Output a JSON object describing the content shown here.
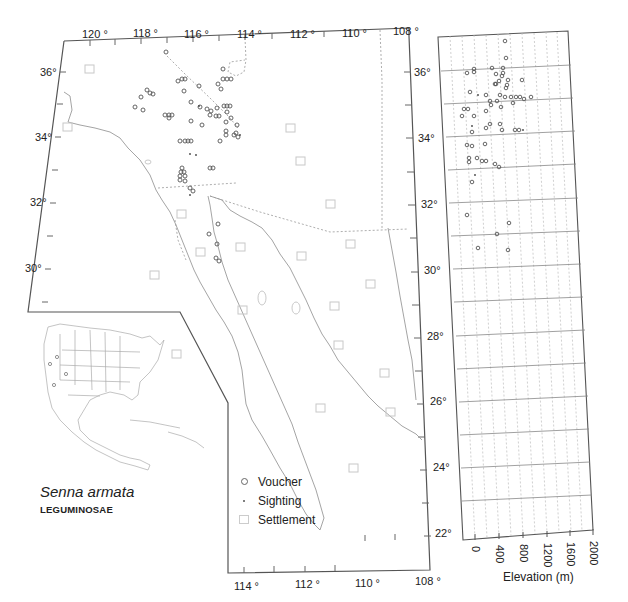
{
  "species": {
    "name": "Senna armata",
    "family": "LEGUMINOSAE"
  },
  "legend": {
    "items": [
      {
        "label": "Voucher",
        "symbol": "circle"
      },
      {
        "label": "Sighting",
        "symbol": "dot"
      },
      {
        "label": "Settlement",
        "symbol": "square"
      }
    ]
  },
  "main_map": {
    "top_longitude_labels": [
      "120 °",
      "118 °",
      "116 °",
      "114 °",
      "112 °",
      "110 °",
      "108 °"
    ],
    "bottom_longitude_labels": [
      "114 °",
      "112 °",
      "110 °",
      "108 °"
    ],
    "left_latitude_labels": [
      "36°",
      "34°",
      "32°",
      "30°"
    ],
    "right_latitude_labels": [
      "36°",
      "34°",
      "32°",
      "30°",
      "28°",
      "26°",
      "24°",
      "22°"
    ]
  },
  "elevation_panel": {
    "axis_title": "Elevation (m)",
    "x_ticks": [
      "0",
      "400",
      "800",
      "1200",
      "1600",
      "2000"
    ],
    "latitude_range": [
      22,
      37
    ]
  },
  "colors": {
    "frame": "#555555",
    "coast": "#aaaaaa",
    "point": "#555555",
    "settlement": "#c8c8c8",
    "grid": "#bbbbbb"
  }
}
